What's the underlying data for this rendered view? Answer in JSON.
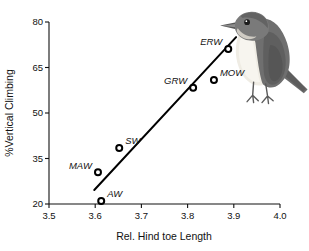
{
  "chart_data": {
    "type": "scatter",
    "title": "",
    "xlabel": "Rel. Hind toe Length",
    "ylabel": "%Vertical Climbing",
    "xlim": [
      3.5,
      4.0
    ],
    "ylim": [
      20,
      80
    ],
    "xticks": [
      "3.5",
      "3.6",
      "3.7",
      "3.8",
      "3.9",
      "4.0"
    ],
    "xtick_values": [
      3.5,
      3.6,
      3.7,
      3.8,
      3.9,
      4.0
    ],
    "yticks": [
      "20",
      "35",
      "50",
      "65",
      "80"
    ],
    "ytick_values": [
      20,
      35,
      50,
      65,
      80
    ],
    "grid": false,
    "legend": "none",
    "points": [
      {
        "label": "AW",
        "x": 3.613,
        "y": 21.0,
        "label_side": "right"
      },
      {
        "label": "MAW",
        "x": 3.606,
        "y": 30.5,
        "label_side": "left"
      },
      {
        "label": "SW",
        "x": 3.652,
        "y": 38.5,
        "label_side": "right"
      },
      {
        "label": "GRW",
        "x": 3.812,
        "y": 58.3,
        "label_side": "left"
      },
      {
        "label": "MOW",
        "x": 3.857,
        "y": 60.9,
        "label_side": "right"
      },
      {
        "label": "ERW",
        "x": 3.888,
        "y": 71.1,
        "label_side": "left"
      }
    ],
    "fit_line": {
      "type": "linear-regression",
      "x_start": 3.598,
      "y_start": 24.6,
      "x_end": 3.905,
      "y_end": 75.0
    },
    "annotations": [
      {
        "name": "bird-illustration",
        "description": "perched warbler, gray-brown upperparts, pale underparts"
      }
    ]
  },
  "axes": {
    "x_axis_label": "Rel. Hind toe Length",
    "y_axis_label": "%Vertical Climbing"
  },
  "colors": {
    "axis": "#111111",
    "marker_fill": "#ffffff",
    "marker_stroke": "#000000",
    "line": "#000000",
    "bird_dark": "#6e6e6e",
    "bird_mid": "#9a9a9a",
    "bird_light": "#e8e4dc",
    "background": "#ffffff"
  }
}
